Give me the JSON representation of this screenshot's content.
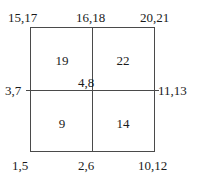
{
  "diagram": {
    "type": "quadrant-node-numbering",
    "shape": "square divided into four quadrants by one vertical and one horizontal line",
    "line_color": "#4a4a4a",
    "background_color": "#ffffff",
    "text_color": "#1a1a1a"
  },
  "corner_labels": {
    "top_left": "15,17",
    "top_center": "16,18",
    "top_right": "20,21",
    "middle_left": "3,7",
    "center": "4,8",
    "middle_right": "11,13",
    "bottom_left": "1,5",
    "bottom_center": "2,6",
    "bottom_right": "10,12"
  },
  "quadrants": {
    "top_left": "19",
    "top_right": "22",
    "bottom_left": "9",
    "bottom_right": "14"
  }
}
